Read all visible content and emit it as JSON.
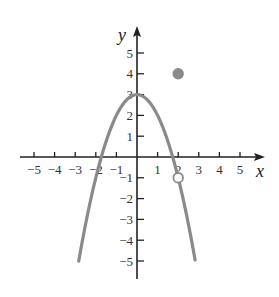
{
  "chart_data": {
    "type": "line",
    "title": "",
    "xlabel": "x",
    "ylabel": "y",
    "xlim": [
      -5,
      5
    ],
    "ylim": [
      -5,
      5
    ],
    "grid": false,
    "x_ticks": [
      -5,
      -4,
      -3,
      -2,
      -1,
      1,
      2,
      3,
      4,
      5
    ],
    "y_ticks": [
      -5,
      -4,
      -3,
      -2,
      -1,
      1,
      2,
      3,
      4,
      5
    ],
    "series": [
      {
        "name": "f(x) = 3 - x^2",
        "style": "curve",
        "color": "#8a8a8a",
        "x": [
          -2.83,
          -2,
          -1.5,
          -1,
          -0.5,
          0,
          0.5,
          1,
          1.5,
          2,
          2.83
        ],
        "y": [
          -5,
          -1,
          0.75,
          2,
          2.75,
          3,
          2.75,
          2,
          0.75,
          -1,
          -5
        ]
      }
    ],
    "points": [
      {
        "name": "filled-point",
        "x": 2,
        "y": 4,
        "filled": true,
        "color": "#8a8a8a"
      },
      {
        "name": "open-point",
        "x": 2,
        "y": -1,
        "filled": false,
        "color": "#8a8a8a"
      }
    ]
  },
  "labels": {
    "x_axis": "x",
    "y_axis": "y",
    "x_ticks": [
      "−5",
      "−4",
      "−3",
      "−2",
      "−1",
      "1",
      "2",
      "3",
      "4",
      "5"
    ],
    "y_ticks_pos": [
      "5",
      "4",
      "3",
      "2",
      "1"
    ],
    "y_ticks_neg": [
      "−1",
      "−2",
      "−3",
      "−4",
      "−5"
    ]
  }
}
